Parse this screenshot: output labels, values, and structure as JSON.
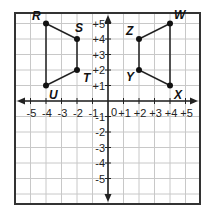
{
  "diagram": {
    "type": "coordinate-grid",
    "x_range": [
      -5,
      5
    ],
    "y_range": [
      -5,
      5
    ],
    "grid_min": -6,
    "grid_max": 6,
    "x_tick_labels": [
      "-5",
      "-4",
      "-3",
      "-2",
      "-1",
      "+1",
      "+2",
      "+3",
      "+4",
      "+5"
    ],
    "y_tick_labels": [
      "+5",
      "+4",
      "+3",
      "+2",
      "+1",
      "-1",
      "-2",
      "-3",
      "-4",
      "-5"
    ],
    "origin_label": "0",
    "colors": {
      "grid": "#c8c8c8",
      "axis": "#222222",
      "frame": "#333333",
      "shape": "#222222",
      "point": "#111111"
    },
    "figures": [
      {
        "name": "RSTU",
        "points": [
          {
            "label": "R",
            "x": -4,
            "y": 5,
            "label_dx": -14,
            "label_dy": -4
          },
          {
            "label": "S",
            "x": -2,
            "y": 4,
            "label_dx": -2,
            "label_dy": -7
          },
          {
            "label": "T",
            "x": -2,
            "y": 2,
            "label_dx": 6,
            "label_dy": 12
          },
          {
            "label": "U",
            "x": -4,
            "y": 1,
            "label_dx": 3,
            "label_dy": 13
          }
        ]
      },
      {
        "name": "WZYX",
        "points": [
          {
            "label": "W",
            "x": 4,
            "y": 5,
            "label_dx": 4,
            "label_dy": -5
          },
          {
            "label": "Z",
            "x": 2,
            "y": 4,
            "label_dx": -13,
            "label_dy": -4
          },
          {
            "label": "Y",
            "x": 2,
            "y": 2,
            "label_dx": -13,
            "label_dy": 11
          },
          {
            "label": "X",
            "x": 4,
            "y": 1,
            "label_dx": 4,
            "label_dy": 13
          }
        ]
      }
    ]
  }
}
